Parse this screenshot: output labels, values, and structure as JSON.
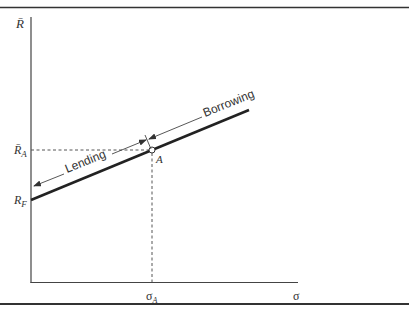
{
  "diagram": {
    "type": "capital-market-line",
    "y_axis": {
      "label": "R̄",
      "label_base": "R",
      "bar": true
    },
    "x_axis": {
      "label": "σ"
    },
    "y_ticks": [
      {
        "id": "RA",
        "base": "R̄",
        "sub": "A",
        "y": 150
      },
      {
        "id": "RF",
        "base": "R",
        "sub": "F",
        "y": 200
      }
    ],
    "x_ticks": [
      {
        "id": "sigmaA",
        "base": "σ",
        "sub": "A",
        "x": 152
      }
    ],
    "line": {
      "from": [
        31,
        200
      ],
      "to": [
        249,
        110
      ]
    },
    "point": {
      "label": "A",
      "x": 152,
      "y": 150
    },
    "annotations": {
      "lending": "Lending",
      "borrowing": "Borrowing"
    },
    "labels": {
      "y_axis": "R̄",
      "RA_base": "R̄",
      "RA_sub": "A",
      "RF_base": "R",
      "RF_sub": "F",
      "sigmaA_base": "σ",
      "sigmaA_sub": "A",
      "sigma": "σ",
      "point": "A"
    }
  }
}
